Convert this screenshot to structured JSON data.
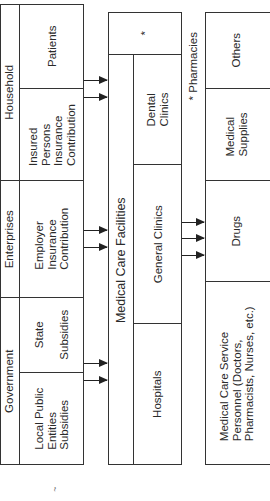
{
  "diagram": {
    "funding_sources": {
      "groups": [
        {
          "label": "Household",
          "items": [
            {
              "label_lines": [
                "Patients"
              ]
            },
            {
              "label_lines": [
                "Insured",
                "Persons",
                "Insurance",
                "Contribution"
              ]
            }
          ]
        },
        {
          "label": "Enterprises",
          "items": [
            {
              "label_lines": [
                "Employer",
                "Insurance",
                "Contribution"
              ]
            }
          ]
        },
        {
          "label": "Government",
          "items": [
            {
              "label_lines": [
                "State",
                "",
                "Subsidies"
              ]
            },
            {
              "label_lines": [
                "Local Public",
                "Entities",
                "Subsidies"
              ]
            }
          ]
        }
      ]
    },
    "facilities": {
      "title": "Medical  Care  Facilities",
      "star_cell": "*",
      "items": [
        {
          "label_lines": [
            "Dental",
            "Clinics"
          ]
        },
        {
          "label_lines": [
            "General  Clinics"
          ]
        },
        {
          "label_lines": [
            "Hospitals"
          ]
        }
      ]
    },
    "footnote": "*  Pharmacies",
    "resources": {
      "items": [
        {
          "label_lines": [
            "Others"
          ]
        },
        {
          "label_lines": [
            "Medical",
            "Supplies"
          ]
        },
        {
          "label_lines": [
            "Drugs"
          ]
        },
        {
          "label_lines": [
            "Medical  Care  Service",
            "Personnel  (Doctors,",
            "Pharmacists,  Nurses,  etc.)"
          ]
        }
      ]
    },
    "bottom_mark": "~",
    "colors": {
      "line": "#333333",
      "text": "#2a2a2a",
      "background": "#ffffff"
    }
  }
}
